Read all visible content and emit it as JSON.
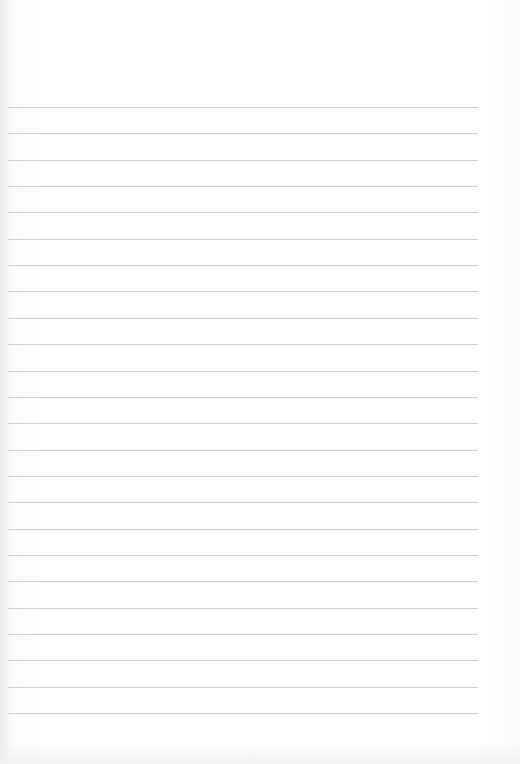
{
  "page": {
    "type": "blank lined paper",
    "line_count": 24,
    "first_line_y": 107,
    "line_spacing": 26.35,
    "line_color": "#cfcfcf",
    "background_color": "#ffffff"
  }
}
